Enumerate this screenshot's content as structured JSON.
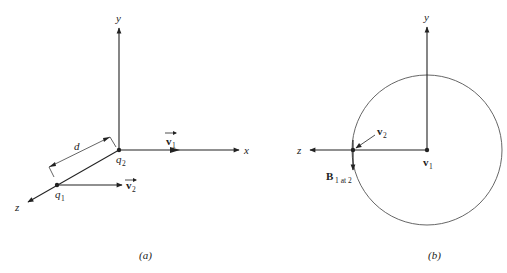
{
  "panel_a": {
    "caption": "(a)",
    "axes": {
      "x": "x",
      "y": "y",
      "z": "z"
    },
    "charges": {
      "q1": {
        "base": "q",
        "sub": "1"
      },
      "q2": {
        "base": "q",
        "sub": "2"
      }
    },
    "velocities": {
      "v1": {
        "base": "v",
        "sub": "1"
      },
      "v2": {
        "base": "v",
        "sub": "2"
      }
    },
    "distance_label": "d"
  },
  "panel_b": {
    "caption": "(b)",
    "axes": {
      "y": "y",
      "z": "z"
    },
    "velocities": {
      "v1": {
        "base": "v",
        "sub": "1"
      },
      "v2": {
        "base": "v",
        "sub": "2"
      }
    },
    "field": {
      "base": "B",
      "sub": "1 at 2"
    }
  },
  "colors": {
    "line": "#222222",
    "circle": "#555555",
    "background": "#ffffff"
  }
}
